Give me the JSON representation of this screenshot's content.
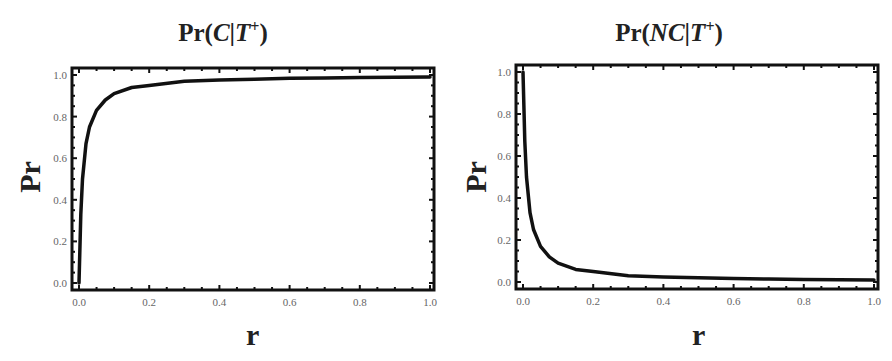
{
  "chart_data": [
    {
      "type": "line",
      "title": "Pr(C|T+)",
      "title_parts": {
        "prefix": "Pr(",
        "italic": "C",
        "sep": "|",
        "italic2": "T",
        "sup": "+",
        "suffix": ")"
      },
      "xlabel": "r",
      "ylabel": "Pr",
      "xlim": [
        0,
        1
      ],
      "ylim": [
        0,
        1
      ],
      "xticks": [
        "0.0",
        "0.2",
        "0.4",
        "0.6",
        "0.8",
        "1.0"
      ],
      "yticks": [
        "0.0",
        "0.2",
        "0.4",
        "0.6",
        "0.8",
        "1.0"
      ],
      "grid": false,
      "frame": true,
      "series": [
        {
          "name": "Pr(C|T+)",
          "x": [
            0.0,
            0.005,
            0.01,
            0.02,
            0.03,
            0.05,
            0.075,
            0.1,
            0.15,
            0.2,
            0.3,
            0.4,
            0.5,
            0.6,
            0.7,
            0.8,
            0.9,
            1.0
          ],
          "values": [
            0.0,
            0.33,
            0.5,
            0.67,
            0.75,
            0.83,
            0.88,
            0.91,
            0.94,
            0.95,
            0.97,
            0.976,
            0.98,
            0.984,
            0.986,
            0.988,
            0.989,
            0.99
          ]
        }
      ],
      "color": "#111111"
    },
    {
      "type": "line",
      "title": "Pr(NC|T+)",
      "title_parts": {
        "prefix": "Pr(",
        "italic": "NC",
        "sep": "|",
        "italic2": "T",
        "sup": "+",
        "suffix": ")"
      },
      "xlabel": "r",
      "ylabel": "Pr",
      "xlim": [
        0,
        1
      ],
      "ylim": [
        0,
        1
      ],
      "xticks": [
        "0.0",
        "0.2",
        "0.4",
        "0.6",
        "0.8",
        "1.0"
      ],
      "yticks": [
        "0.0",
        "0.2",
        "0.4",
        "0.6",
        "0.8",
        "1.0"
      ],
      "grid": false,
      "frame": true,
      "series": [
        {
          "name": "Pr(NC|T+)",
          "x": [
            0.0,
            0.005,
            0.01,
            0.02,
            0.03,
            0.05,
            0.075,
            0.1,
            0.15,
            0.2,
            0.3,
            0.4,
            0.5,
            0.6,
            0.7,
            0.8,
            0.9,
            1.0
          ],
          "values": [
            1.0,
            0.67,
            0.5,
            0.33,
            0.25,
            0.17,
            0.12,
            0.09,
            0.06,
            0.05,
            0.03,
            0.024,
            0.02,
            0.016,
            0.014,
            0.012,
            0.011,
            0.01
          ]
        }
      ],
      "color": "#111111"
    }
  ]
}
